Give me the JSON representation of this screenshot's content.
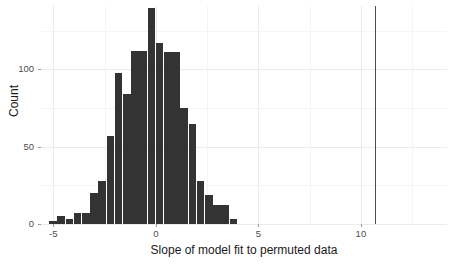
{
  "chart_data": {
    "type": "bar",
    "title": "",
    "subtitle": "",
    "xlabel": "Slope of model fit to permuted data",
    "ylabel": "Count",
    "xlim": [
      -5.6,
      14.2
    ],
    "ylim": [
      0,
      141
    ],
    "xticks": [
      -5,
      0,
      5,
      10
    ],
    "xtick_labels": [
      "-5",
      "0",
      "5",
      "10"
    ],
    "yticks": [
      0,
      50,
      100
    ],
    "ytick_labels": [
      "0",
      "50",
      "100"
    ],
    "grid": true,
    "grid_minor_y": [
      25,
      75,
      125
    ],
    "grid_minor_x": [
      -2.5,
      2.5,
      7.5,
      12.5
    ],
    "legend": "none",
    "bin_width": 0.4,
    "bar_color": "#333333",
    "grid_color": "#ebebeb",
    "panel_background": "#ffffff",
    "annotations": [
      {
        "name": "observed-slope-vline",
        "type": "vline",
        "x": 10.7,
        "color": "#4d4d4d"
      }
    ],
    "bin_centers": [
      -5.0,
      -4.6,
      -4.2,
      -3.8,
      -3.4,
      -3.0,
      -2.6,
      -2.2,
      -1.8,
      -1.4,
      -1.0,
      -0.6,
      -0.2,
      0.2,
      0.6,
      1.0,
      1.4,
      1.8,
      2.2,
      2.6,
      3.0,
      3.4,
      3.8
    ],
    "categories": [
      "-5.0",
      "-4.6",
      "-4.2",
      "-3.8",
      "-3.4",
      "-3.0",
      "-2.6",
      "-2.2",
      "-1.8",
      "-1.4",
      "-1.0",
      "-0.6",
      "-0.2",
      "0.2",
      "0.6",
      "1.0",
      "1.4",
      "1.8",
      "2.2",
      "2.6",
      "3.0",
      "3.4",
      "3.8"
    ],
    "values": [
      2,
      5,
      3,
      7,
      7,
      20,
      28,
      57,
      98,
      84,
      112,
      112,
      140,
      117,
      111,
      111,
      75,
      65,
      28,
      19,
      12,
      12,
      3
    ]
  }
}
